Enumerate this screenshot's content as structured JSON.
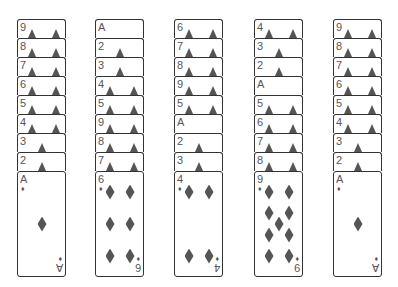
{
  "game": {
    "suit": "diamonds",
    "suit_glyph": "♦",
    "columns": [
      {
        "stack": [
          "9",
          "8",
          "7",
          "6",
          "5",
          "4",
          "3",
          "2"
        ],
        "face_up": "A"
      },
      {
        "stack": [
          "A",
          "2",
          "3",
          "4",
          "5",
          "9",
          "8",
          "7"
        ],
        "face_up": "6"
      },
      {
        "stack": [
          "6",
          "7",
          "8",
          "9",
          "5",
          "A",
          "2",
          "3"
        ],
        "face_up": "4"
      },
      {
        "stack": [
          "4",
          "3",
          "2",
          "A",
          "5",
          "6",
          "7",
          "8"
        ],
        "face_up": "9"
      },
      {
        "stack": [
          "9",
          "8",
          "7",
          "6",
          "5",
          "4",
          "3",
          "2"
        ],
        "face_up": "A"
      }
    ]
  },
  "labels": {
    "c0": [
      "9",
      "8",
      "7",
      "6",
      "5",
      "4",
      "3",
      "2",
      "A"
    ],
    "c1": [
      "A",
      "2",
      "3",
      "4",
      "5",
      "9",
      "8",
      "7",
      "6"
    ],
    "c2": [
      "6",
      "7",
      "8",
      "9",
      "5",
      "A",
      "2",
      "3",
      "4"
    ],
    "c3": [
      "4",
      "3",
      "2",
      "A",
      "5",
      "6",
      "7",
      "8",
      "9"
    ],
    "c4": [
      "9",
      "8",
      "7",
      "6",
      "5",
      "4",
      "3",
      "2",
      "A"
    ]
  },
  "suit_glyph": "♦"
}
